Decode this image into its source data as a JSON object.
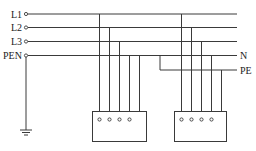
{
  "diagram": {
    "title": "",
    "type": "TN-C-S earthing system wiring diagram",
    "bus_labels": {
      "l1": "L1",
      "l2": "L2",
      "l3": "L3",
      "pen": "PEN",
      "n": "N",
      "pe": "PE"
    },
    "components": [
      {
        "id": "source-bus",
        "kind": "supply lines",
        "lines": [
          "L1",
          "L2",
          "L3",
          "PEN"
        ]
      },
      {
        "id": "ground",
        "kind": "earth ground symbol",
        "connected_to": "PEN"
      },
      {
        "id": "load-1",
        "kind": "equipment box",
        "terminals": 4,
        "connected_to": [
          "L1",
          "L2",
          "L3",
          "PEN"
        ]
      },
      {
        "id": "load-2",
        "kind": "equipment box",
        "terminals": 4,
        "connected_to": [
          "L1",
          "L2",
          "L3",
          "N"
        ],
        "enclosure_to": "PE"
      }
    ],
    "colors": {
      "line": "#3a3a3a",
      "background": "#ffffff",
      "text": "#222222"
    }
  }
}
